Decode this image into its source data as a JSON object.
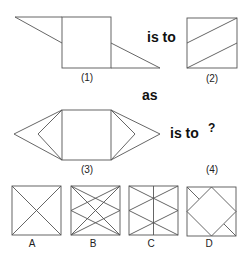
{
  "question": {
    "words": {
      "is_to_1": "is to",
      "as": "as",
      "is_to_2": "is to",
      "unknown": "?"
    },
    "figure_labels": [
      "(1)",
      "(2)",
      "(3)",
      "(4)"
    ]
  },
  "options": [
    {
      "label": "A"
    },
    {
      "label": "B"
    },
    {
      "label": "C"
    },
    {
      "label": "D"
    }
  ],
  "colors": {
    "stroke": "#555555",
    "text": "#111111"
  }
}
